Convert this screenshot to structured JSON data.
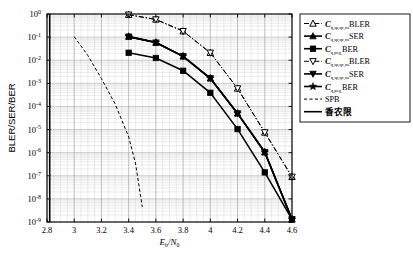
{
  "chart_data": {
    "type": "line",
    "title": "",
    "xlabel": "Eb/N0",
    "xlabel_main": "E",
    "xlabel_sub1": "b",
    "xlabel_div": "/N",
    "xlabel_sub2": "0",
    "ylabel": "BLER/SER/BER",
    "xlim": [
      2.8,
      4.6
    ],
    "ylim": [
      1e-09,
      1
    ],
    "xticks": [
      "2.8",
      "3",
      "3.2",
      "3.4",
      "3.6",
      "3.8",
      "4",
      "4.2",
      "4.4",
      "4.6"
    ],
    "xtick_values": [
      2.8,
      3.0,
      3.2,
      3.4,
      3.6,
      3.8,
      4.0,
      4.2,
      4.4,
      4.6
    ],
    "yticks": [
      "10^0",
      "10^-1",
      "10^-2",
      "10^-3",
      "10^-4",
      "10^-5",
      "10^-6",
      "10^-7",
      "10^-8",
      "10^-9"
    ],
    "ytick_exponents": [
      "0",
      "-1",
      "-2",
      "-3",
      "-4",
      "-5",
      "-6",
      "-7",
      "-8",
      "-9"
    ],
    "ytick_values": [
      1,
      0.1,
      0.01,
      0.001,
      0.0001,
      1e-05,
      1e-06,
      1e-07,
      1e-08,
      1e-09
    ],
    "grid": true,
    "grid_minor": true,
    "legend_position": "right-outside",
    "yscale": "log",
    "series": [
      {
        "name": "C_q,sp,qc,ns BLER",
        "marker": "triangle-up-open",
        "linestyle": "dashdot",
        "x": [
          3.4,
          3.6,
          3.8,
          4.0,
          4.2,
          4.4,
          4.6
        ],
        "y": [
          0.93,
          0.58,
          0.18,
          0.021,
          0.0006,
          7.5e-06,
          9e-08
        ]
      },
      {
        "name": "C_q,sp,qc,ns SER",
        "marker": "triangle-up-filled",
        "linestyle": "solid",
        "x": [
          3.4,
          3.6,
          3.8,
          4.0,
          4.2,
          4.4,
          4.6
        ],
        "y": [
          0.105,
          0.058,
          0.0148,
          0.00165,
          5e-05,
          1.05e-06,
          1.3e-09
        ]
      },
      {
        "name": "C_q,peg BER",
        "marker": "square-filled",
        "linestyle": "solid",
        "x": [
          3.4,
          3.6,
          3.8,
          4.0,
          4.2,
          4.4,
          4.6
        ],
        "y": [
          0.021,
          0.0125,
          0.0035,
          0.00039,
          1.05e-05,
          1.4e-07,
          1.3e-09
        ]
      },
      {
        "name": "C_q,sp,qc,ns BLER (2)",
        "marker": "triangle-down-open",
        "linestyle": "dashdot",
        "x": [
          3.4,
          3.6,
          3.8,
          4.0,
          4.2,
          4.4,
          4.6
        ],
        "y": [
          0.93,
          0.58,
          0.18,
          0.021,
          0.0006,
          7.5e-06,
          9e-08
        ]
      },
      {
        "name": "C_q,sp,qc,ns SER (2)",
        "marker": "triangle-down-filled",
        "linestyle": "solid",
        "x": [
          3.4,
          3.6,
          3.8,
          4.0,
          4.2,
          4.4,
          4.6
        ],
        "y": [
          0.105,
          0.058,
          0.0148,
          0.00165,
          5e-05,
          1.05e-06,
          1.3e-09
        ]
      },
      {
        "name": "C_q,peg BER (2)",
        "marker": "star-filled",
        "linestyle": "solid",
        "x": [
          3.4,
          3.6,
          3.8,
          4.0,
          4.2,
          4.4,
          4.6
        ],
        "y": [
          0.105,
          0.058,
          0.0148,
          0.00165,
          5e-05,
          1.05e-06,
          1.3e-09
        ]
      },
      {
        "name": "SPB",
        "marker": "none",
        "linestyle": "dashed",
        "x": [
          3.0,
          3.1,
          3.2,
          3.3,
          3.4,
          3.45,
          3.5
        ],
        "y": [
          0.105,
          0.016,
          0.0016,
          0.00013,
          4.8e-06,
          3.5e-07,
          4.5e-09
        ]
      },
      {
        "name": "香农限",
        "marker": "none",
        "linestyle": "solid-vertical",
        "x": [
          2.82,
          2.82
        ],
        "y": [
          1,
          1e-09
        ]
      }
    ]
  },
  "legend": {
    "entries": [
      {
        "sym": "triangle-up-open",
        "line": "dashdot",
        "var": "C",
        "sub": "q,sp,qc,ns",
        "tail": "BLER"
      },
      {
        "sym": "triangle-up-filled",
        "line": "solid",
        "var": "C",
        "sub": "q,sp,qc,ns",
        "tail": "SER"
      },
      {
        "sym": "square-filled",
        "line": "solid",
        "var": "C",
        "sub": "q,peg,",
        "tail": "BER"
      },
      {
        "sym": "triangle-down-open",
        "line": "dashdot",
        "var": "C",
        "sub": "q,sp,qc,ns",
        "tail": "BLER"
      },
      {
        "sym": "triangle-down-filled",
        "line": "solid",
        "var": "C",
        "sub": "q,sp,qc,ns",
        "tail": "SER"
      },
      {
        "sym": "star-filled",
        "line": "solid",
        "var": "C",
        "sub": "q,peg,",
        "tail": "BER"
      },
      {
        "sym": "none",
        "line": "dashed",
        "var": "",
        "sub": "",
        "tail": "SPB"
      },
      {
        "sym": "none",
        "line": "solid",
        "var": "",
        "sub": "",
        "tail": "香农限"
      }
    ]
  },
  "colors": {
    "line": "#000000",
    "grid": "#c9c9c9",
    "background": "#ffffff"
  }
}
